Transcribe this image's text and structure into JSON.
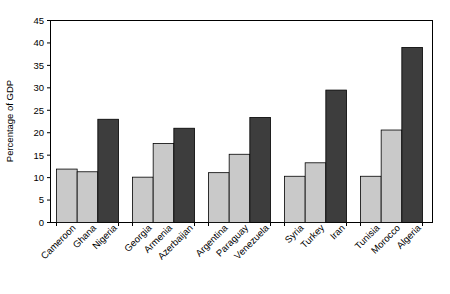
{
  "chart_data": {
    "type": "bar",
    "title": "",
    "xlabel": "",
    "ylabel": "Percentage of GDP",
    "ylim": [
      0,
      45
    ],
    "ytick_step": 5,
    "yticks": [
      0,
      5,
      10,
      15,
      20,
      25,
      30,
      35,
      40,
      45
    ],
    "ytick_labels": [
      "0",
      "5",
      "10",
      "15",
      "20",
      "25",
      "30",
      "35",
      "40",
      "45"
    ],
    "grid": false,
    "legend": "none",
    "categories": [
      "Cameroon",
      "Ghana",
      "Nigeria",
      "Georgia",
      "Armenia",
      "Azerbaijan",
      "Argentina",
      "Paraguay",
      "Venezuela",
      "Syria",
      "Turkey",
      "Iran",
      "Tunisia",
      "Morocco",
      "Algeria"
    ],
    "values": [
      11.9,
      11.3,
      23.0,
      10.1,
      17.6,
      21.0,
      11.1,
      15.2,
      23.4,
      10.3,
      13.3,
      29.5,
      10.3,
      20.6,
      39.0
    ],
    "bar_colors": [
      "light",
      "light",
      "dark",
      "light",
      "light",
      "dark",
      "light",
      "light",
      "dark",
      "light",
      "light",
      "dark",
      "light",
      "light",
      "dark"
    ],
    "groups": [
      {
        "name": "group-1",
        "categories": [
          "Cameroon",
          "Ghana",
          "Nigeria"
        ],
        "values": [
          11.9,
          11.3,
          23.0
        ]
      },
      {
        "name": "group-2",
        "categories": [
          "Georgia",
          "Armenia",
          "Azerbaijan"
        ],
        "values": [
          10.1,
          17.6,
          21.0
        ]
      },
      {
        "name": "group-3",
        "categories": [
          "Argentina",
          "Paraguay",
          "Venezuela"
        ],
        "values": [
          11.1,
          15.2,
          23.4
        ]
      },
      {
        "name": "group-4",
        "categories": [
          "Syria",
          "Turkey",
          "Iran"
        ],
        "values": [
          10.3,
          13.3,
          29.5
        ]
      },
      {
        "name": "group-5",
        "categories": [
          "Tunisia",
          "Morocco",
          "Algeria"
        ],
        "values": [
          10.3,
          20.6,
          39.0
        ]
      }
    ],
    "colors": {
      "light_bar": "#c9c9c9",
      "dark_bar": "#3d3d3d",
      "bar_outline": "#000000",
      "axis": "#000000",
      "background": "#ffffff"
    }
  }
}
